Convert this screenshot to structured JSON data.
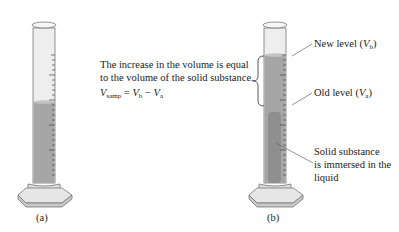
{
  "figure": {
    "panel_a": {
      "caption": "(a)"
    },
    "panel_b": {
      "caption": "(b)",
      "label_new_level": {
        "text": "New level (",
        "var": "V",
        "sub": "b",
        "close": ")"
      },
      "label_old_level": {
        "text": "Old level (",
        "var": "V",
        "sub": "a",
        "close": ")"
      },
      "label_solid": [
        "Solid substance",
        "is immersed in the",
        "liquid"
      ]
    },
    "explanation": {
      "lines": [
        "The increase in the volume is equal",
        "to the volume of the solid substance."
      ],
      "equation": {
        "lhs_var": "V",
        "lhs_sub": "samp",
        "eq": " = ",
        "v1": "V",
        "v1_sub": "b",
        "minus": " − ",
        "v2": "V",
        "v2_sub": "a"
      }
    },
    "colors": {
      "liquid": "#a6a6a6",
      "solid": "#8f8f8f",
      "glass": "#ececec",
      "outline": "#555555"
    }
  }
}
